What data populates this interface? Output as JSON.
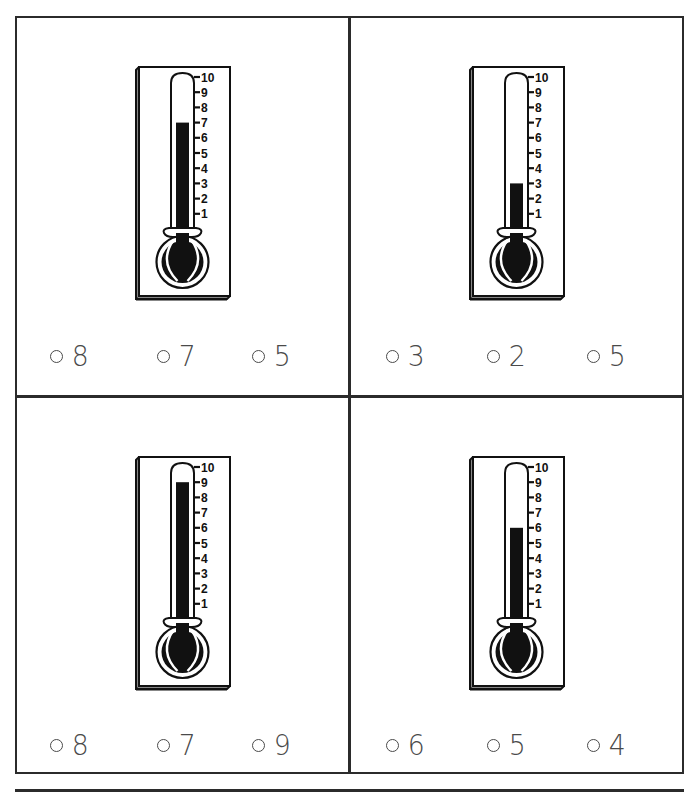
{
  "worksheet": {
    "type": "thermometer-reading-multiple-choice",
    "scale": {
      "min": 1,
      "max": 10,
      "tick_labels": [
        "10",
        "9",
        "8",
        "7",
        "6",
        "5",
        "4",
        "3",
        "2",
        "1"
      ]
    },
    "colors": {
      "ink": "#111111",
      "border": "#2b2b2b",
      "option_text": "#4a4a4a",
      "background": "#ffffff"
    },
    "problems": [
      {
        "id": "top-left",
        "thermometer_value": 7,
        "options": [
          {
            "bubble": "○",
            "label": "8"
          },
          {
            "bubble": "○",
            "label": "7"
          },
          {
            "bubble": "○",
            "label": "5"
          }
        ]
      },
      {
        "id": "top-right",
        "thermometer_value": 3,
        "options": [
          {
            "bubble": "○",
            "label": "3"
          },
          {
            "bubble": "○",
            "label": "2"
          },
          {
            "bubble": "○",
            "label": "5"
          }
        ]
      },
      {
        "id": "bottom-left",
        "thermometer_value": 9,
        "options": [
          {
            "bubble": "○",
            "label": "8"
          },
          {
            "bubble": "○",
            "label": "7"
          },
          {
            "bubble": "○",
            "label": "9"
          }
        ]
      },
      {
        "id": "bottom-right",
        "thermometer_value": 6,
        "options": [
          {
            "bubble": "○",
            "label": "6"
          },
          {
            "bubble": "○",
            "label": "5"
          },
          {
            "bubble": "○",
            "label": "4"
          }
        ]
      }
    ]
  }
}
